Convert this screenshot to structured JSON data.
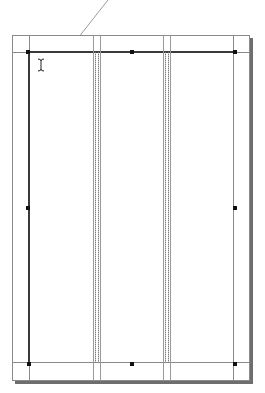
{
  "app": {
    "view": "page-layout",
    "columns": 3,
    "cursor": "ibeam-cursor"
  },
  "colors": {
    "page_border": "#8a8a8a",
    "margin_guide": "#3a3a3a",
    "column_guide": "#9a9a9a",
    "shadow": "#6e6e6e",
    "handle": "#111111"
  }
}
